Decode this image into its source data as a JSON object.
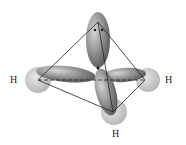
{
  "diagram": {
    "atoms": [
      {
        "label": "H",
        "position": "left"
      },
      {
        "label": "H",
        "position": "right"
      },
      {
        "label": "H",
        "position": "bottom"
      }
    ],
    "lone_pair": {
      "symbol": "••",
      "position": "top"
    },
    "colors": {
      "lobe": "#7a7a7a",
      "h_sphere": "#c8c8c8",
      "edge": "#222222"
    }
  }
}
